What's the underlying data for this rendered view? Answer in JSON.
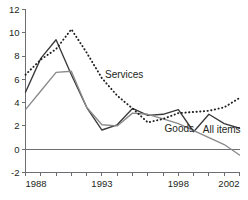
{
  "chart_data": {
    "type": "line",
    "title": "",
    "subtitle": "",
    "xlabel": "",
    "ylabel": "",
    "xlim": [
      1988,
      2002
    ],
    "ylim": [
      -2,
      12
    ],
    "yticks": [
      -2,
      0,
      2,
      4,
      6,
      8,
      10,
      12
    ],
    "ytick_labels": [
      "-2",
      "0",
      "2",
      "4",
      "6",
      "8",
      "10",
      "12"
    ],
    "xticks": [
      1988,
      1989,
      1990,
      1991,
      1992,
      1993,
      1994,
      1995,
      1996,
      1997,
      1998,
      1999,
      2000,
      2001,
      2002
    ],
    "xtick_labels_shown": [
      "1988",
      "1993",
      "1998",
      "2002"
    ],
    "xtick_label_years": [
      1988,
      1993,
      1998,
      2002
    ],
    "grid": false,
    "legend_position": "inline-annotations",
    "zero_line": 0,
    "x": [
      1988,
      1989,
      1990,
      1991,
      1992,
      1993,
      1994,
      1995,
      1996,
      1997,
      1998,
      1999,
      2000,
      2001,
      2002
    ],
    "series": [
      {
        "name": "All items",
        "color": "#3a3a3c",
        "style": "solid",
        "label": "All items",
        "values": [
          4.9,
          7.8,
          9.4,
          6.4,
          3.6,
          1.65,
          2.1,
          3.5,
          2.9,
          3.0,
          3.4,
          1.5,
          3.0,
          2.2,
          1.8
        ]
      },
      {
        "name": "Goods",
        "color": "#8a8a8d",
        "style": "solid",
        "label": "Goods",
        "values": [
          3.4,
          5.0,
          6.6,
          6.7,
          3.6,
          2.1,
          2.0,
          3.1,
          3.0,
          2.6,
          2.2,
          1.6,
          1.0,
          0.4,
          -0.5
        ]
      },
      {
        "name": "Services",
        "color": "#231f20",
        "style": "dotted",
        "label": "Services",
        "values": [
          6.4,
          7.7,
          8.6,
          10.3,
          8.3,
          6.1,
          4.6,
          3.5,
          2.3,
          2.6,
          3.1,
          3.2,
          3.3,
          3.6,
          4.4
        ]
      }
    ],
    "annotations": [
      {
        "text": "Services",
        "x": 1993.2,
        "y": 6.1,
        "series": "Services"
      },
      {
        "text": "Goods",
        "x": 1997.1,
        "y": 1.45,
        "series": "Goods"
      },
      {
        "text": "All items",
        "x": 1999.6,
        "y": 1.35,
        "series": "All items"
      }
    ]
  },
  "colors": {
    "axis": "#6d6e71",
    "text": "#231f20",
    "all_items": "#3a3a3c",
    "goods": "#8a8a8d",
    "services": "#231f20",
    "background": "#ffffff"
  }
}
